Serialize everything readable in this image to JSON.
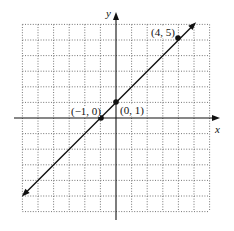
{
  "chart_data": {
    "type": "line",
    "title": "",
    "xlabel": "x",
    "ylabel": "y",
    "xlim": [
      -6,
      6
    ],
    "ylim": [
      -6,
      6
    ],
    "grid": true,
    "grid_style": "dotted",
    "grid_step": 1,
    "series": [
      {
        "name": "y = x + 1",
        "equation": "y = x + 1",
        "slope": 1,
        "intercept": 1,
        "x": [
          -5.9,
          5
        ],
        "y": [
          -4.9,
          6
        ],
        "arrows": "both"
      }
    ],
    "points": [
      {
        "x": -1,
        "y": 0,
        "label": "(−1, 0)"
      },
      {
        "x": 0,
        "y": 1,
        "label": "(0, 1)"
      },
      {
        "x": 4,
        "y": 5,
        "label": "(4, 5)"
      }
    ],
    "legend": null
  },
  "labels": {
    "x_axis": "x",
    "y_axis": "y",
    "point_a": "(−1, 0)",
    "point_b": "(0, 1)",
    "point_c": "(4, 5)"
  },
  "colors": {
    "line": "#111111",
    "grid": "#555555",
    "background": "#ffffff"
  }
}
